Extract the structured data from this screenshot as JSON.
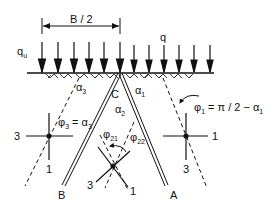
{
  "diagram": {
    "dimension_label": "B / 2",
    "loads": {
      "footing_load_label": "q",
      "footing_load_sub": "u",
      "surcharge_label": "q"
    },
    "points": {
      "apex": "C",
      "left_end": "B",
      "right_end": "A"
    },
    "angles": {
      "alpha3": {
        "sym": "α",
        "sub": "3"
      },
      "alpha1": {
        "sym": "α",
        "sub": "1"
      },
      "alpha2": {
        "sym": "α",
        "sub": "2"
      },
      "phi21": {
        "sym": "φ",
        "sub": "21"
      },
      "phi22": {
        "sym": "φ",
        "sub": "22"
      }
    },
    "equations": {
      "phi1": {
        "lhs_sym": "φ",
        "lhs_sub": "1",
        "rhs": " = π / 2 − α",
        "rhs_sub": "1"
      },
      "phi3": {
        "lhs_sym": "φ",
        "lhs_sub": "3",
        "rhs": " = α",
        "rhs_sub": "3"
      }
    },
    "stress_axes": {
      "left": {
        "horizontal": "3",
        "vertical": "1"
      },
      "right": {
        "horizontal": "1",
        "vertical": "3"
      },
      "bottom": {
        "left": "3",
        "right": "1"
      }
    },
    "colors": {
      "line": "#111111",
      "background": "#ffffff"
    }
  }
}
